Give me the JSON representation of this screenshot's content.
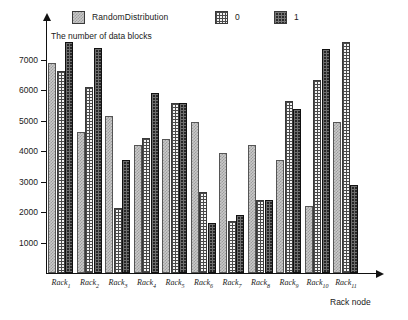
{
  "chart_data": {
    "type": "bar",
    "title": "",
    "ylabel": "The number of data blocks",
    "xlabel": "Rack node",
    "categories": [
      "Rack1",
      "Rack2",
      "Rack3",
      "Rack4",
      "Rack5",
      "Rack6",
      "Rack7",
      "Rack8",
      "Rack9",
      "Rack10",
      "Rack11"
    ],
    "category_labels": [
      {
        "base": "Rack",
        "sub": "1"
      },
      {
        "base": "Rack",
        "sub": "2"
      },
      {
        "base": "Rack",
        "sub": "3"
      },
      {
        "base": "Rack",
        "sub": "4"
      },
      {
        "base": "Rack",
        "sub": "5"
      },
      {
        "base": "Rack",
        "sub": "6"
      },
      {
        "base": "Rack",
        "sub": "7"
      },
      {
        "base": "Rack",
        "sub": "8"
      },
      {
        "base": "Rack",
        "sub": "9"
      },
      {
        "base": "Rack",
        "sub": "10"
      },
      {
        "base": "Rack",
        "sub": "11"
      }
    ],
    "series": [
      {
        "name": "RandomDistribution",
        "values": [
          6900,
          4650,
          5150,
          4200,
          4400,
          4950,
          3950,
          4200,
          3700,
          2200,
          4950
        ]
      },
      {
        "name": "0",
        "values": [
          6650,
          6100,
          2150,
          4450,
          5600,
          2650,
          1700,
          2400,
          5650,
          6350,
          7600
        ]
      },
      {
        "name": "1",
        "values": [
          7600,
          7400,
          3700,
          5900,
          5600,
          1650,
          1900,
          2400,
          5400,
          7350,
          2900
        ]
      }
    ],
    "ylim": [
      0,
      8000
    ],
    "yticks": [
      1000,
      2000,
      3000,
      4000,
      5000,
      6000,
      7000
    ],
    "ytick_labels": [
      "1000",
      "2000",
      "3000",
      "4000",
      "5000",
      "6000",
      "7000"
    ],
    "grid": false,
    "legend_position": "top"
  },
  "legend": {
    "items": [
      {
        "label": "RandomDistribution",
        "swatch": "random-distribution-swatch"
      },
      {
        "label": "0",
        "swatch": "zero-series-swatch"
      },
      {
        "label": "1",
        "swatch": "one-series-swatch"
      }
    ]
  },
  "colors": {
    "series_random": "#c9c9c9",
    "series_zero": "#f4f4f4",
    "series_one": "#262626",
    "axis": "#111111",
    "text": "#1a1a1a"
  }
}
